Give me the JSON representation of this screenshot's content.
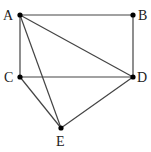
{
  "diagram": {
    "type": "graph",
    "points": [
      {
        "id": "A",
        "label": "A",
        "x": 20,
        "y": 15,
        "lx": 3,
        "ly": 20
      },
      {
        "id": "B",
        "label": "B",
        "x": 133,
        "y": 15,
        "lx": 138,
        "ly": 20
      },
      {
        "id": "C",
        "label": "C",
        "x": 20,
        "y": 77,
        "lx": 4,
        "ly": 82
      },
      {
        "id": "D",
        "label": "D",
        "x": 133,
        "y": 77,
        "lx": 137,
        "ly": 82
      },
      {
        "id": "E",
        "label": "E",
        "x": 61,
        "y": 128,
        "lx": 56,
        "ly": 146
      }
    ],
    "edges": [
      [
        "A",
        "B"
      ],
      [
        "B",
        "D"
      ],
      [
        "A",
        "C"
      ],
      [
        "C",
        "D"
      ],
      [
        "A",
        "D"
      ],
      [
        "A",
        "E"
      ],
      [
        "C",
        "E"
      ],
      [
        "D",
        "E"
      ]
    ],
    "line_color": "#444444",
    "point_color": "#000000"
  }
}
